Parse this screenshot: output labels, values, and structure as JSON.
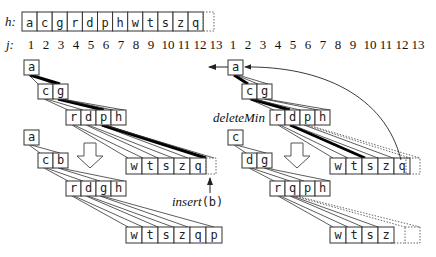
{
  "labels": {
    "h": "h:",
    "j": "j:",
    "delete_min": "deleteMin",
    "insert_fn": "insert",
    "insert_arg": "(b)"
  },
  "array_h": [
    "a",
    "c",
    "g",
    "r",
    "d",
    "p",
    "h",
    "w",
    "t",
    "s",
    "z",
    "q"
  ],
  "indices_left": [
    "1",
    "2",
    "3",
    "4",
    "5",
    "6",
    "7",
    "8",
    "9",
    "10",
    "11",
    "12",
    "13"
  ],
  "indices_right": [
    "1",
    "2",
    "3",
    "4",
    "5",
    "6",
    "7",
    "8",
    "9",
    "10",
    "11",
    "12",
    "13"
  ],
  "left_before": {
    "level0": [
      "a"
    ],
    "level1": [
      "c",
      "g"
    ],
    "level2": [
      "r",
      "d",
      "p",
      "h"
    ],
    "level3": [
      "w",
      "t",
      "s",
      "z",
      "q"
    ]
  },
  "left_after": {
    "level0": [
      "a"
    ],
    "level1": [
      "c",
      "b"
    ],
    "level2": [
      "r",
      "d",
      "g",
      "h"
    ],
    "level3": [
      "w",
      "t",
      "s",
      "z",
      "q",
      "p"
    ]
  },
  "right_before": {
    "level0": [
      "a"
    ],
    "level1": [
      "c",
      "g"
    ],
    "level2": [
      "r",
      "d",
      "p",
      "h"
    ],
    "level3": [
      "w",
      "t",
      "s",
      "z",
      "q"
    ]
  },
  "right_after": {
    "level0": [
      "c"
    ],
    "level1": [
      "d",
      "g"
    ],
    "level2": [
      "r",
      "q",
      "p",
      "h"
    ],
    "level3": [
      "w",
      "t",
      "s",
      "z"
    ]
  }
}
